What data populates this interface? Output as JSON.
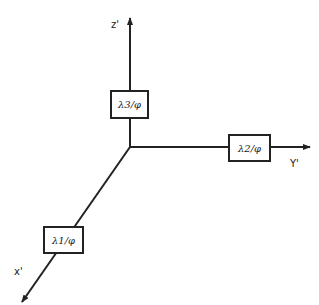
{
  "diagram": {
    "type": "3D coordinate axes with labeled boxes",
    "axes": [
      {
        "name": "z'",
        "label": "z'",
        "direction": "up"
      },
      {
        "name": "y'",
        "label": "Y'",
        "direction": "right"
      },
      {
        "name": "x'",
        "label": "x'",
        "direction": "down-left"
      }
    ],
    "boxes": [
      {
        "axis": "z'",
        "text": "λ3/φ"
      },
      {
        "axis": "y'",
        "text": "λ2/φ"
      },
      {
        "axis": "x'",
        "text": "λ1/φ"
      }
    ]
  }
}
